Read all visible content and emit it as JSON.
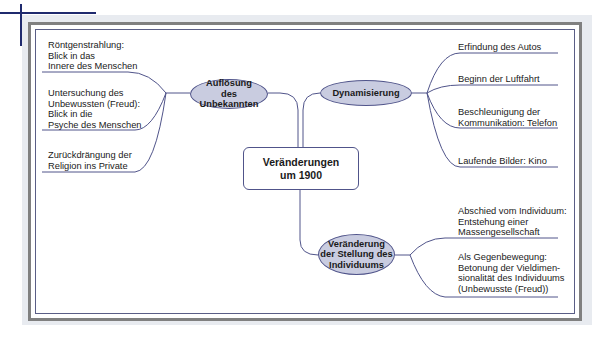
{
  "diagram": {
    "type": "mind-map",
    "center": {
      "label": "Veränderungen\num 1900"
    },
    "branches": [
      {
        "id": "aufloesung",
        "label": "Auflösung\ndes Unbekannten",
        "side": "left",
        "children": [
          "Röntgenstrahlung:\nBlick in das\nInnere des Menschen",
          "Untersuchung des\nUnbewussten (Freud):\nBlick in die\nPsyche des Menschen",
          "Zurückdrängung der\nReligion ins Private"
        ]
      },
      {
        "id": "dynamisierung",
        "label": "Dynamisierung",
        "side": "right",
        "children": [
          "Erfindung des Autos",
          "Beginn der Luftfahrt",
          "Beschleunigung der\nKommunikation: Telefon",
          "Laufende Bilder: Kino"
        ]
      },
      {
        "id": "individuum",
        "label": "Veränderung\nder Stellung des\nIndividuums",
        "side": "right",
        "children": [
          "Abschied vom Individuum:\nEntstehung einer\nMassengesellschaft",
          "Als Gegenbewegung:\nBetonung der Vieldimen-\nsionalität des Individuums\n(Unbewusste (Freud))"
        ]
      }
    ],
    "colors": {
      "oval_fill": "#c9cce0",
      "line": "#50548a",
      "frame": "#808080",
      "panel": "#e8ebf0",
      "crop_marks": "#1f2a6e"
    }
  }
}
